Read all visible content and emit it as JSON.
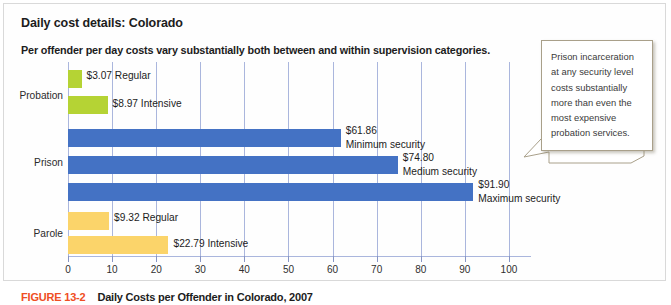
{
  "panel": {
    "title": "Daily cost details: Colorado",
    "subtitle": "Per offender per day costs vary substantially both between and within supervision categories."
  },
  "callout": {
    "text": "Prison incarceration at any security level costs substantially more than even the most expensive probation services."
  },
  "caption": {
    "figure_number": "FIGURE 13-2",
    "text": "Daily Costs per Offender in Colorado, 2007"
  },
  "colors": {
    "probation": "#b5d334",
    "prison": "#4472c4",
    "parole": "#fbd46a",
    "gridline": "#aab6dd",
    "figure_number": "#ef4e23"
  },
  "chart_data": {
    "type": "bar",
    "orientation": "horizontal",
    "title": "Daily cost details: Colorado",
    "subtitle": "Per offender per day costs vary substantially both between and within supervision categories.",
    "xlabel": "",
    "ylabel": "",
    "xlim": [
      0,
      105
    ],
    "xticks": [
      0,
      10,
      20,
      30,
      40,
      50,
      60,
      70,
      80,
      90,
      100
    ],
    "xtick_labels": [
      "0",
      "10",
      "20",
      "30",
      "40",
      "50",
      "60",
      "70",
      "80",
      "90",
      "100"
    ],
    "grid": true,
    "legend": "none",
    "groups": [
      {
        "name": "Probation",
        "color": "#b5d334",
        "bars": [
          {
            "label": "Regular",
            "value": 3.07,
            "value_label": "$3.07",
            "data_label": "$3.07 Regular"
          },
          {
            "label": "Intensive",
            "value": 8.97,
            "value_label": "$8.97",
            "data_label": "$8.97 Intensive"
          }
        ]
      },
      {
        "name": "Prison",
        "color": "#4472c4",
        "bars": [
          {
            "label": "Minimum security",
            "value": 61.86,
            "value_label": "$61.86",
            "data_label": "$61.86 Minimum security"
          },
          {
            "label": "Medium security",
            "value": 74.8,
            "value_label": "$74.80",
            "data_label": "$74.80 Medium security"
          },
          {
            "label": "Maximum security",
            "value": 91.9,
            "value_label": "$91.90",
            "data_label": "$91.90 Maximum security"
          }
        ]
      },
      {
        "name": "Parole",
        "color": "#fbd46a",
        "bars": [
          {
            "label": "Regular",
            "value": 9.32,
            "value_label": "$9.32",
            "data_label": "$9.32 Regular"
          },
          {
            "label": "Intensive",
            "value": 22.79,
            "value_label": "$22.79",
            "data_label": "$22.79 Intensive"
          }
        ]
      }
    ],
    "categories": [
      "Probation Regular",
      "Probation Intensive",
      "Prison Minimum security",
      "Prison Medium security",
      "Prison Maximum security",
      "Parole Regular",
      "Parole Intensive"
    ],
    "values": [
      3.07,
      8.97,
      61.86,
      74.8,
      91.9,
      9.32,
      22.79
    ]
  }
}
